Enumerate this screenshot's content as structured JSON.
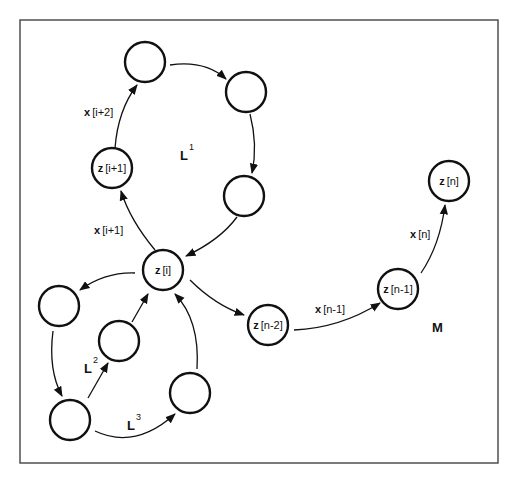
{
  "diagram": {
    "frame": {
      "x": 20,
      "y": 20,
      "width": 478,
      "height": 443
    },
    "nodes": [
      {
        "id": "top",
        "cx": 145,
        "cy": 62,
        "label_var": "",
        "label_idx": ""
      },
      {
        "id": "top-right",
        "cx": 246,
        "cy": 92,
        "label_var": "",
        "label_idx": ""
      },
      {
        "id": "l1-right",
        "cx": 244,
        "cy": 196,
        "label_var": "",
        "label_idx": ""
      },
      {
        "id": "z-i-plus-1",
        "cx": 112,
        "cy": 168,
        "label_var": "z",
        "label_idx": "[i+1]"
      },
      {
        "id": "z-i",
        "cx": 163,
        "cy": 270,
        "label_var": "z",
        "label_idx": "[i]"
      },
      {
        "id": "l2-left",
        "cx": 59,
        "cy": 306,
        "label_var": "",
        "label_idx": ""
      },
      {
        "id": "l2-mid",
        "cx": 119,
        "cy": 341,
        "label_var": "",
        "label_idx": ""
      },
      {
        "id": "bottom-left",
        "cx": 70,
        "cy": 420,
        "label_var": "",
        "label_idx": ""
      },
      {
        "id": "l3-right",
        "cx": 190,
        "cy": 393,
        "label_var": "",
        "label_idx": ""
      },
      {
        "id": "z-n-minus-2",
        "cx": 268,
        "cy": 325,
        "label_var": "z",
        "label_idx": "[n-2]"
      },
      {
        "id": "z-n-minus-1",
        "cx": 398,
        "cy": 289,
        "label_var": "z",
        "label_idx": "[n-1]"
      },
      {
        "id": "z-n",
        "cx": 449,
        "cy": 181,
        "label_var": "z",
        "label_idx": "[n]"
      }
    ],
    "edge_labels": {
      "x_i_plus_2": {
        "var": "x",
        "idx": "[i+2]"
      },
      "x_i_plus_1": {
        "var": "x",
        "idx": "[i+1]"
      },
      "x_n_minus_1": {
        "var": "x",
        "idx": "[n-1]"
      },
      "x_n": {
        "var": "x",
        "idx": "[n]"
      }
    },
    "loop_labels": {
      "L1": {
        "base": "L",
        "sup": "1"
      },
      "L2": {
        "base": "L",
        "sup": "2"
      },
      "L3": {
        "base": "L",
        "sup": "3"
      },
      "M": {
        "base": "M"
      }
    },
    "colors": {
      "stroke": "#111111",
      "frame": "#444444",
      "background": "#ffffff"
    }
  }
}
